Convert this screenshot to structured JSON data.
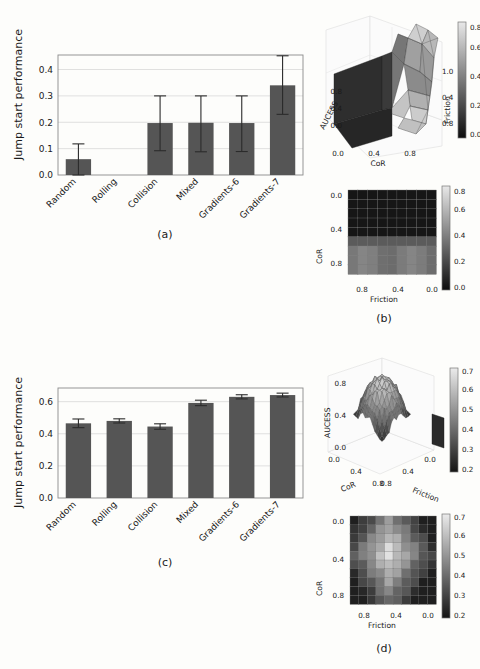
{
  "figure": {
    "caption_a": "(a)",
    "caption_b": "(b)",
    "caption_c": "(c)",
    "caption_d": "(d)",
    "bar_color": "#555555",
    "background": "#fdfdfb"
  },
  "chart_data": [
    {
      "id": "panel_a",
      "type": "bar",
      "title": "",
      "panel_label": "(a)",
      "xlabel": "",
      "ylabel": "Jump start performance",
      "categories": [
        "Random",
        "Rolling",
        "Collision",
        "Mixed",
        "Gradients-6",
        "Gradients-7"
      ],
      "values": [
        0.06,
        0.0,
        0.197,
        0.198,
        0.197,
        0.34
      ],
      "err_low": [
        0.06,
        0.0,
        0.105,
        0.11,
        0.108,
        0.11
      ],
      "err_high": [
        0.058,
        0.0,
        0.103,
        0.102,
        0.103,
        0.112
      ],
      "ylim": [
        0.0,
        0.455
      ],
      "yticks": [
        "0.0",
        "0.1",
        "0.2",
        "0.3",
        "0.4"
      ],
      "ytick_values": [
        0.0,
        0.1,
        0.2,
        0.3,
        0.4
      ],
      "grid": true,
      "xtick_rotation": -45
    },
    {
      "id": "panel_b_surface",
      "type": "surface",
      "panel_label": "(b)",
      "xlabel": "CoR",
      "ylabel": "Friction",
      "zlabel": "AUCESS",
      "xticks": [
        "0.0",
        "0.4",
        "0.8"
      ],
      "yticks": [
        "1.0",
        "0.4",
        "0.8"
      ],
      "zticks": [
        "0.0",
        "0.4",
        "0.8"
      ],
      "colorbar_ticks": [
        "0.0",
        "0.2",
        "0.4",
        "0.6",
        "0.8"
      ],
      "colorbar_range": [
        0.0,
        0.9
      ],
      "colormap": "gray"
    },
    {
      "id": "panel_b_heatmap",
      "type": "heatmap",
      "panel_label": "(b)",
      "xlabel": "Friction",
      "ylabel": "CoR",
      "xticks": [
        "0.8",
        "0.4",
        "0.0"
      ],
      "yticks": [
        "0.0",
        "0.4",
        "0.8"
      ],
      "colorbar_ticks": [
        "0.0",
        "0.2",
        "0.4",
        "0.6",
        "0.8"
      ],
      "colorbar_range": [
        0.0,
        0.9
      ],
      "colormap": "gray",
      "description": "Low AUCESS (near 0.0) for CoR below ~0.55; higher values (0.3-0.5) for CoR above ~0.6"
    },
    {
      "id": "panel_c",
      "type": "bar",
      "title": "",
      "panel_label": "(c)",
      "xlabel": "",
      "ylabel": "Jump start performance",
      "categories": [
        "Random",
        "Rolling",
        "Collision",
        "Mixed",
        "Gradients-6",
        "Gradients-7"
      ],
      "values": [
        0.465,
        0.48,
        0.445,
        0.592,
        0.63,
        0.641
      ],
      "err_low": [
        0.027,
        0.013,
        0.017,
        0.017,
        0.013,
        0.012
      ],
      "err_high": [
        0.027,
        0.013,
        0.017,
        0.017,
        0.013,
        0.012
      ],
      "ylim": [
        0.0,
        0.685
      ],
      "yticks": [
        "0.0",
        "0.2",
        "0.4",
        "0.6"
      ],
      "ytick_values": [
        0.0,
        0.2,
        0.4,
        0.6
      ],
      "grid": true,
      "xtick_rotation": -45
    },
    {
      "id": "panel_d_surface",
      "type": "surface",
      "panel_label": "(d)",
      "xlabel": "CoR",
      "ylabel": "Friction",
      "zlabel": "AUCESS",
      "xticks": [
        "0.0",
        "0.4",
        "0.8"
      ],
      "yticks": [
        "0.0",
        "0.4",
        "0.8"
      ],
      "zticks": [
        "0.0",
        "0.4",
        "0.8"
      ],
      "colorbar_ticks": [
        "0.2",
        "0.3",
        "0.4",
        "0.5",
        "0.6",
        "0.7"
      ],
      "colorbar_range": [
        0.18,
        0.75
      ],
      "colormap": "gray"
    },
    {
      "id": "panel_d_heatmap",
      "type": "heatmap",
      "panel_label": "(d)",
      "xlabel": "Friction",
      "ylabel": "CoR",
      "xticks": [
        "0.8",
        "0.4",
        "0.0"
      ],
      "yticks": [
        "0.0",
        "0.4",
        "0.8"
      ],
      "colorbar_ticks": [
        "0.2",
        "0.3",
        "0.4",
        "0.5",
        "0.6",
        "0.7"
      ],
      "colorbar_range": [
        0.18,
        0.75
      ],
      "colormap": "gray",
      "description": "Bright ridge through the centre (AUCESS ~0.7) fading to dark at the corners (~0.25)"
    }
  ]
}
